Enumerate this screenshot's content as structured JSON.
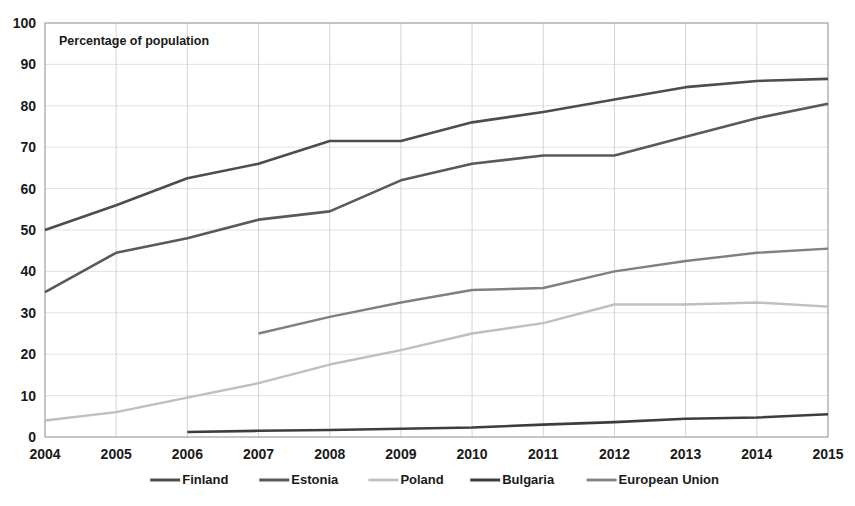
{
  "chart_data": {
    "type": "line",
    "title": "",
    "annotation": "Percentage of population",
    "xlabel": "",
    "ylabel": "",
    "x": [
      2004,
      2005,
      2006,
      2007,
      2008,
      2009,
      2010,
      2011,
      2012,
      2013,
      2014,
      2015
    ],
    "categories": [
      "2004",
      "2005",
      "2006",
      "2007",
      "2008",
      "2009",
      "2010",
      "2011",
      "2012",
      "2013",
      "2014",
      "2015"
    ],
    "xlim": [
      2004,
      2015
    ],
    "ylim": [
      0,
      100
    ],
    "yticks": [
      0,
      10,
      20,
      30,
      40,
      50,
      60,
      70,
      80,
      90,
      100
    ],
    "yticklabels": [
      "0",
      "10",
      "20",
      "30",
      "40",
      "50",
      "60",
      "70",
      "80",
      "90",
      "100"
    ],
    "grid": true,
    "legend_position": "bottom",
    "series": [
      {
        "name": "Finland",
        "color": "#4d4d4d",
        "width": 2.6,
        "values": [
          50,
          56,
          62.5,
          66,
          71.5,
          71.5,
          76,
          78.5,
          81.5,
          84.5,
          86,
          86.5
        ]
      },
      {
        "name": "Estonia",
        "color": "#595959",
        "width": 2.6,
        "values": [
          35,
          44.5,
          48,
          52.5,
          54.5,
          62,
          66,
          68,
          68,
          72.5,
          77,
          80.5
        ]
      },
      {
        "name": "Poland",
        "color": "#bfbfbf",
        "width": 2.4,
        "values": [
          4,
          6,
          9.5,
          13,
          17.5,
          21,
          25,
          27.5,
          32,
          32,
          32.5,
          31.5
        ]
      },
      {
        "name": "Bulgaria",
        "color": "#3d3d3d",
        "width": 2.6,
        "values": [
          null,
          null,
          1.2,
          1.5,
          1.7,
          2,
          2.3,
          3,
          3.6,
          4.4,
          4.7,
          5.5
        ]
      },
      {
        "name": "European Union",
        "color": "#808080",
        "width": 2.4,
        "values": [
          null,
          null,
          null,
          25,
          29,
          32.5,
          35.5,
          36,
          40,
          42.5,
          44.5,
          45.5
        ]
      }
    ]
  },
  "legend": {
    "items": [
      {
        "label": "Finland"
      },
      {
        "label": "Estonia"
      },
      {
        "label": "Poland"
      },
      {
        "label": "Bulgaria"
      },
      {
        "label": "European Union"
      }
    ]
  }
}
